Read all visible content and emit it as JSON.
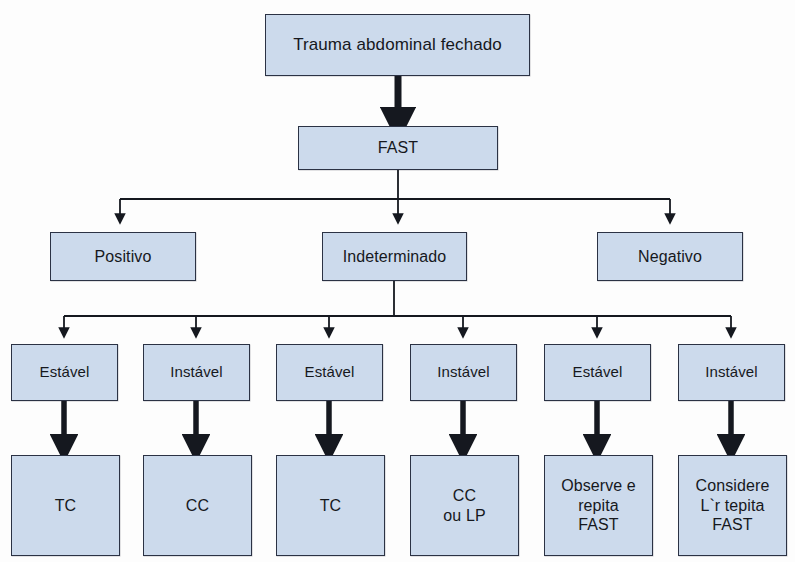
{
  "diagram": {
    "title": "Trauma abdominal fechado",
    "colors": {
      "node_fill": "#ccdaec",
      "node_border": "#2b3244",
      "edge": "#15181f",
      "text": "#16181d",
      "background": "#fdfdfd"
    },
    "levels": [
      {
        "name": "root",
        "nodes": [
          {
            "id": "root",
            "label": "Trauma abdominal fechado"
          }
        ]
      },
      {
        "name": "test",
        "nodes": [
          {
            "id": "fast",
            "label": "FAST"
          }
        ]
      },
      {
        "name": "results",
        "nodes": [
          {
            "id": "positivo",
            "label": "Positivo"
          },
          {
            "id": "indeterminado",
            "label": "Indeterminado"
          },
          {
            "id": "negativo",
            "label": "Negativo"
          }
        ]
      },
      {
        "name": "stability",
        "nodes": [
          {
            "id": "est1",
            "label": "Estável"
          },
          {
            "id": "ins1",
            "label": "Instável"
          },
          {
            "id": "est2",
            "label": "Estável"
          },
          {
            "id": "ins2",
            "label": "Instável"
          },
          {
            "id": "est3",
            "label": "Estável"
          },
          {
            "id": "ins3",
            "label": "Instável"
          }
        ]
      },
      {
        "name": "outcomes",
        "nodes": [
          {
            "id": "out1",
            "label": "TC"
          },
          {
            "id": "out2",
            "label": "CC"
          },
          {
            "id": "out3",
            "label": "TC"
          },
          {
            "id": "out4",
            "label": "CC\nou LP"
          },
          {
            "id": "out5",
            "label": "Observe e\nrepita\nFAST"
          },
          {
            "id": "out6",
            "label": "Considere\nL`r tepita\nFAST"
          }
        ]
      }
    ]
  }
}
